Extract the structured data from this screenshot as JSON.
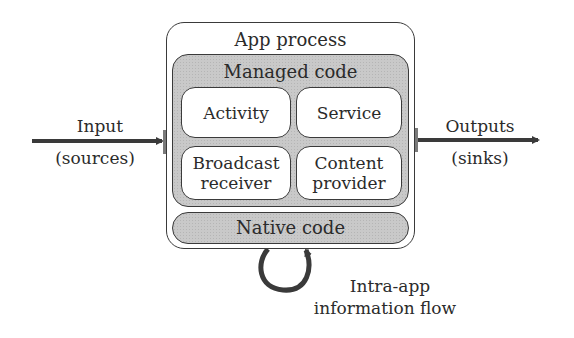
{
  "diagram": {
    "app_process": {
      "title": "App process"
    },
    "managed_code": {
      "title": "Managed code",
      "components": [
        {
          "label": "Activity"
        },
        {
          "label": "Service"
        },
        {
          "label_line1": "Broadcast",
          "label_line2": "receiver"
        },
        {
          "label_line1": "Content",
          "label_line2": "provider"
        }
      ]
    },
    "native_code": {
      "title": "Native code"
    },
    "input": {
      "line1": "Input",
      "line2": "(sources)"
    },
    "output": {
      "line1": "Outputs",
      "line2": "(sinks)"
    },
    "loop": {
      "line1": "Intra-app",
      "line2": "information flow"
    },
    "colors": {
      "stroke": "#3a3a3a",
      "fill_gray": "#c9c9c9",
      "text": "#2b2b2b"
    }
  }
}
